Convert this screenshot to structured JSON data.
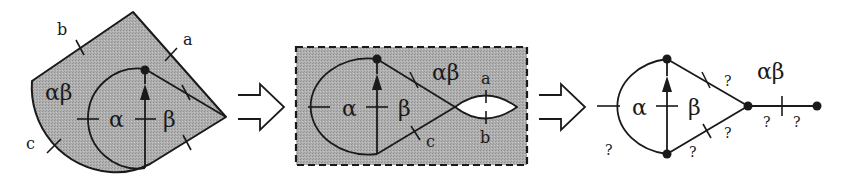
{
  "figure": {
    "colors": {
      "ink": "#1a1a1a",
      "shade": "#a9a9a9",
      "background": "#ffffff"
    }
  },
  "panels": {
    "left": {
      "region_label": "αβ",
      "inner_left_label": "α",
      "inner_right_label": "β",
      "edge_labels": {
        "a": "a",
        "b": "b",
        "c": "c"
      }
    },
    "arrow1": {
      "icon": "hollow-right-arrow-icon"
    },
    "middle": {
      "outer_label": "αβ",
      "inner_left_label": "α",
      "inner_right_label": "β",
      "edge_labels": {
        "a": "a",
        "b": "b",
        "c": "c"
      },
      "frame": "dashed shaded rectangle"
    },
    "arrow2": {
      "icon": "hollow-right-arrow-icon"
    },
    "right": {
      "tail_label": "αβ",
      "inner_left_label": "α",
      "inner_right_label": "β",
      "unknown_label": "?",
      "unknown_labels": [
        "?",
        "?",
        "?",
        "?",
        "?",
        "?",
        "?"
      ]
    }
  }
}
